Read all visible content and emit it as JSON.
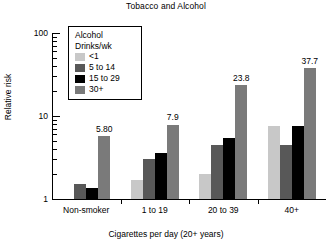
{
  "chart_data": {
    "type": "bar",
    "title": "Tobacco and Alcohol",
    "xlabel": "Cigarettes per day (20+ years)",
    "ylabel": "Relative risk",
    "yscale": "log",
    "ylim": [
      1,
      100
    ],
    "ytick_labels": [
      "100",
      "10",
      "1"
    ],
    "ytick_values": [
      100,
      10,
      1
    ],
    "grid": false,
    "legend_position": "upper-left-inside",
    "legend_title_line1": "Alcohol",
    "legend_title_line2": "Drinks/wk",
    "categories": [
      "Non-smoker",
      "1 to 19",
      "20 to 39",
      "40+"
    ],
    "series": [
      {
        "name": "<1",
        "color": "#c8c8c8",
        "values": [
          1.0,
          1.7,
          2.0,
          7.5
        ],
        "labels": [
          "",
          "",
          "",
          ""
        ]
      },
      {
        "name": "5 to 14",
        "color": "#585858",
        "values": [
          1.5,
          3.0,
          4.5,
          4.5
        ],
        "labels": [
          "",
          "",
          "",
          ""
        ]
      },
      {
        "name": "15 to 29",
        "color": "#000000",
        "values": [
          1.35,
          3.6,
          5.5,
          7.6
        ],
        "labels": [
          "",
          "",
          "",
          ""
        ]
      },
      {
        "name": "30+",
        "color": "#7a7a7a",
        "values": [
          5.8,
          7.9,
          23.8,
          37.7
        ],
        "labels": [
          "5.80",
          "7.9",
          "23.8",
          "37.7"
        ]
      }
    ]
  }
}
